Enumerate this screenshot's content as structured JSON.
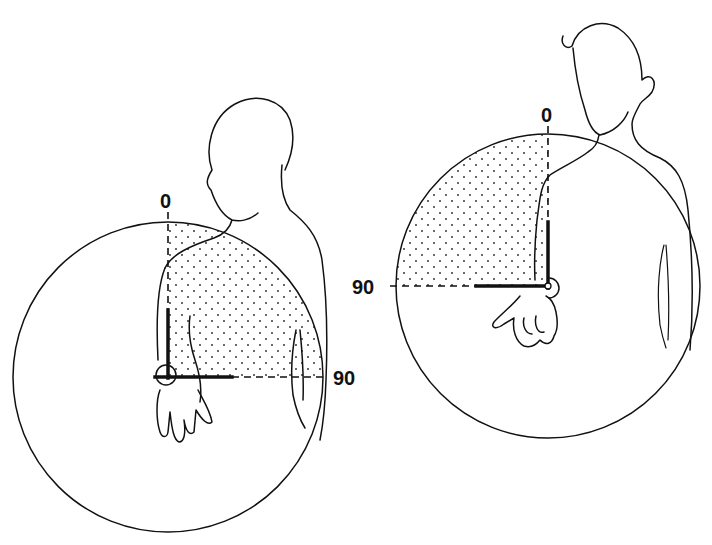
{
  "figure": {
    "panels": [
      {
        "id": "left",
        "description": "Subject facing forward, forearm flexed at elbow, lateral (external) rotation arc shaded",
        "labels": {
          "start": "0",
          "end": "90"
        },
        "start_angle_deg": 0,
        "end_angle_deg": 90,
        "shaded_region": "0 to 90"
      },
      {
        "id": "right",
        "description": "Subject turned, forearm flexed at elbow, medial (internal) rotation arc shaded",
        "labels": {
          "start": "0",
          "end": "90"
        },
        "start_angle_deg": 0,
        "end_angle_deg": 90,
        "shaded_region": "0 to 90"
      }
    ],
    "colors": {
      "ink": "#111111",
      "background": "#ffffff"
    }
  }
}
